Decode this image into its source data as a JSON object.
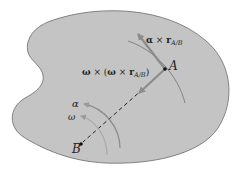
{
  "diagram": {
    "type": "rigid-body-acceleration",
    "colors": {
      "body_fill": "#c4c4c4",
      "body_stroke": "#6a6a6a",
      "arrow": "#8c8c8c",
      "path_curve": "#7a7a7a",
      "text": "#222222",
      "background": "#ffffff"
    },
    "points": {
      "A": {
        "label": "A",
        "x": 165,
        "y": 69
      },
      "B": {
        "label": "B",
        "x": 81,
        "y": 144
      }
    },
    "labels": {
      "tangential": {
        "symbol": "α",
        "times": " × ",
        "r": "r",
        "sub": "A/B"
      },
      "normal": {
        "omega1": "ω",
        "times1": " × (",
        "omega2": "ω",
        "times2": " × ",
        "r": "r",
        "sub": "A/B",
        "close": ")"
      },
      "alpha": "α",
      "omega": "ω"
    }
  }
}
